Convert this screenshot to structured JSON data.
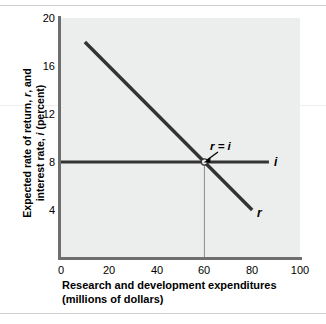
{
  "chart_data": {
    "type": "line",
    "title": "",
    "xlabel": "Research and development expenditures (millions of dollars)",
    "xlabel_line1": "Research and development expenditures",
    "xlabel_line2": "(millions of dollars)",
    "ylabel": "Expected rate of return, r, and interest rate, i (percent)",
    "ylabel_part1": "Expected rate of return, ",
    "ylabel_r": "r",
    "ylabel_part2": ", and",
    "ylabel_part3": "interest rate, ",
    "ylabel_i": "i",
    "ylabel_part4": " (percent)",
    "xlim": [
      0,
      100
    ],
    "ylim": [
      0,
      20
    ],
    "xticks": [
      "0",
      "20",
      "40",
      "60",
      "80",
      "100"
    ],
    "xtick_values": [
      0,
      20,
      40,
      60,
      80,
      100
    ],
    "yticks": [
      "4",
      "8",
      "12",
      "16",
      "20"
    ],
    "ytick_values": [
      4,
      8,
      12,
      16,
      20
    ],
    "grid": false,
    "legend_position": "inline-at-line-end",
    "series": [
      {
        "name": "r",
        "label": "r",
        "description": "Expected rate of return schedule, downward sloping",
        "x": [
          10,
          80
        ],
        "values": [
          18,
          4
        ]
      },
      {
        "name": "i",
        "label": "i",
        "description": "Interest rate, horizontal at 8 percent",
        "x": [
          0,
          87
        ],
        "values": [
          8,
          8
        ]
      }
    ],
    "annotations": [
      {
        "text": "r = i",
        "x": 60,
        "y": 8,
        "description": "Equilibrium point where expected rate of return equals interest rate"
      }
    ],
    "equilibrium": {
      "x": 60,
      "y": 8,
      "dropline": true
    },
    "colors": {
      "plot_background": "#eceded",
      "line": "#333333",
      "axis": "#6e6e6e",
      "text": "#000000",
      "dropline": "#8a8a8a"
    }
  }
}
